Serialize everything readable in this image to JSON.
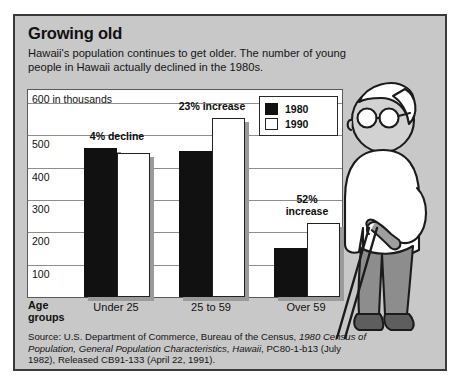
{
  "figure": {
    "headline": "Growing old",
    "subhead": "Hawaii's population continues to get older. The number of young people in Hawaii actually declined in the 1980s.",
    "axis_unit_label": "600 in thousands",
    "age_groups_label": "Age\ngroups",
    "source_prefix": "Source: U.S. Department of Commerce, Bureau of the Census, ",
    "source_italic_1": "1980 Census of Population, General Population Characteristics, Hawaii",
    "source_mid": ", PC80-1-b13 (July 1982),",
    "source_tail": "Released CB91-133 (April 22, 1991)."
  },
  "legend": {
    "items": [
      {
        "label": "1980",
        "swatch": "dark",
        "color": "#111111"
      },
      {
        "label": "1990",
        "swatch": "light",
        "color": "#ffffff"
      }
    ]
  },
  "annotations": [
    {
      "text": "4% decline",
      "group": "Under 25"
    },
    {
      "text": "23% increase",
      "group": "25 to 59"
    },
    {
      "text": "52%\nincrease",
      "group": "Over 59"
    }
  ],
  "chart_data": {
    "type": "bar",
    "title": "Growing old",
    "subtitle": "Hawaii's population continues to get older. The number of young people in Hawaii actually declined in the 1980s.",
    "xlabel": "Age groups",
    "ylabel": "in thousands",
    "unit": "thousands",
    "categories": [
      "Under 25",
      "25 to 59",
      "Over 59"
    ],
    "series": [
      {
        "name": "1980",
        "color": "#111111",
        "values": [
          462,
          450,
          150
        ]
      },
      {
        "name": "1990",
        "color": "#ffffff",
        "values": [
          444,
          553,
          228
        ]
      }
    ],
    "yticks": [
      100,
      200,
      300,
      400,
      500,
      600
    ],
    "ylim": [
      0,
      640
    ],
    "grid": true,
    "legend_position": "top-right",
    "annotations": [
      "4% decline",
      "23% increase",
      "52% increase"
    ]
  }
}
